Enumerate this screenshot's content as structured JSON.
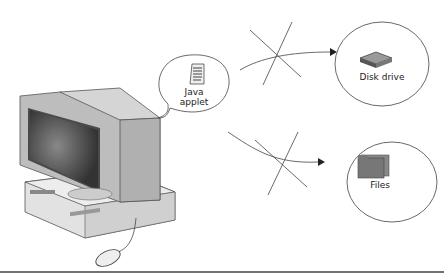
{
  "diagram": {
    "bubble": {
      "line1": "Java",
      "line2": "applet",
      "icon": "document-icon"
    },
    "targets": [
      {
        "label": "Disk drive",
        "icon": "disk-drive-icon",
        "access": "blocked"
      },
      {
        "label": "Files",
        "icon": "folder-icon",
        "access": "blocked"
      }
    ],
    "devices": [
      "computer-monitor",
      "desktop-unit",
      "mouse"
    ],
    "colors": {
      "line": "#444444",
      "fill": "#cccccc",
      "screen": "#555555"
    }
  }
}
